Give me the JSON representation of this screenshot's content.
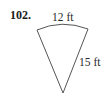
{
  "problem": {
    "number": "102."
  },
  "figure": {
    "shape": "circular sector",
    "arc_length_label": "12 ft",
    "radius_label": "15 ft",
    "stroke_color": "#555555"
  }
}
